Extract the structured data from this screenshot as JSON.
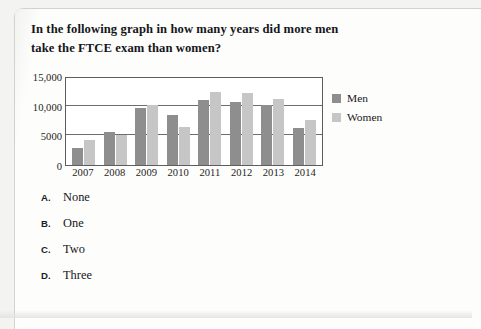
{
  "question": "In the following graph in how many years did more men take the FTCE exam than women?",
  "chart_data": {
    "type": "bar",
    "title": "",
    "xlabel": "",
    "ylabel": "",
    "categories": [
      "2007",
      "2008",
      "2009",
      "2010",
      "2011",
      "2012",
      "2013",
      "2014"
    ],
    "series": [
      {
        "name": "Men",
        "color": "#8e8e8e",
        "values": [
          2800,
          5500,
          9600,
          8400,
          11000,
          10700,
          10100,
          6300
        ]
      },
      {
        "name": "Women",
        "color": "#c6c6c6",
        "values": [
          4300,
          5100,
          10100,
          6400,
          12300,
          12200,
          11100,
          7600
        ]
      }
    ],
    "ylim": [
      0,
      15000
    ],
    "yticks": [
      0,
      5000,
      10000,
      15000
    ],
    "ytick_labels": [
      "0",
      "5000",
      "10,000",
      "15,000"
    ],
    "grid": true,
    "gridlines_at": [
      5000,
      10000
    ],
    "legend_position": "right"
  },
  "legend": {
    "items": [
      {
        "label": "Men"
      },
      {
        "label": "Women"
      }
    ]
  },
  "options": [
    {
      "letter": "A.",
      "text": "None"
    },
    {
      "letter": "B.",
      "text": "One"
    },
    {
      "letter": "C.",
      "text": "Two"
    },
    {
      "letter": "D.",
      "text": "Three"
    }
  ]
}
